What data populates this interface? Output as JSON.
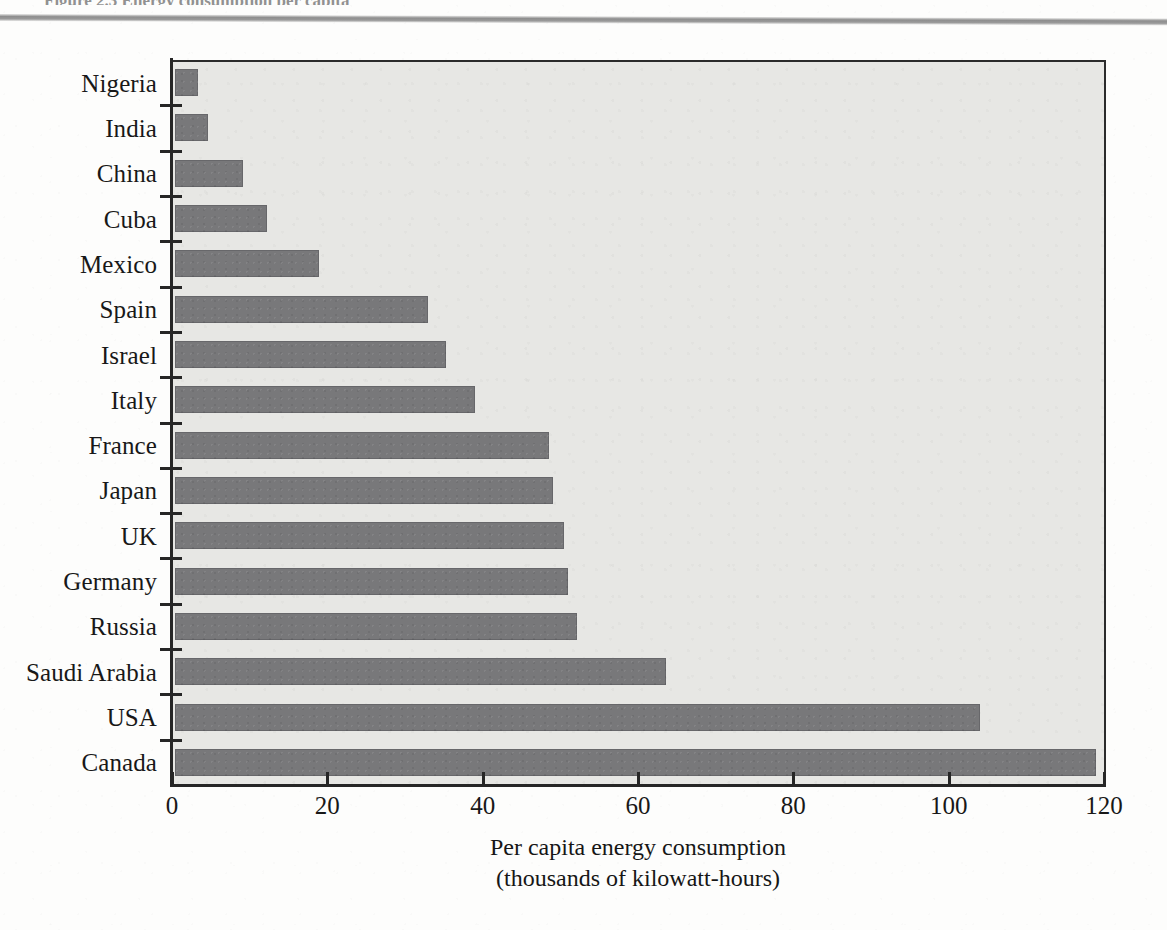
{
  "page": {
    "top_caption_fragment": "Figure 2.3  Energy consumption per capita",
    "header_rule": "horizontal-rule"
  },
  "chart_data": {
    "type": "bar",
    "orientation": "horizontal",
    "title": "",
    "subtitle": "",
    "xlabel_line1": "Per capita energy consumption",
    "xlabel_line2": "(thousands of kilowatt-hours)",
    "ylabel": "",
    "xlim": [
      0,
      120
    ],
    "ylim": null,
    "grid": false,
    "legend": null,
    "xticks": [
      "0",
      "20",
      "40",
      "60",
      "80",
      "100",
      "120"
    ],
    "xtick_values": [
      0,
      20,
      40,
      60,
      80,
      100,
      120
    ],
    "categories": [
      "Nigeria",
      "India",
      "China",
      "Cuba",
      "Mexico",
      "Spain",
      "Israel",
      "Italy",
      "France",
      "Japan",
      "UK",
      "Germany",
      "Russia",
      "Saudi Arabia",
      "USA",
      "Canada"
    ],
    "values": [
      3.0,
      4.3,
      8.8,
      11.8,
      18.5,
      32.6,
      34.9,
      38.6,
      48.2,
      48.7,
      50.1,
      50.6,
      51.8,
      63.2,
      103.6,
      118.6
    ],
    "units": "thousands of kilowatt-hours per person",
    "colors": {
      "bar_fill": "#78787a",
      "plot_background": "#e7e7e4",
      "axis": "#262626",
      "text": "#181818",
      "page_background": "#fdfdfc",
      "header_rule": "#8e8e8e"
    }
  }
}
